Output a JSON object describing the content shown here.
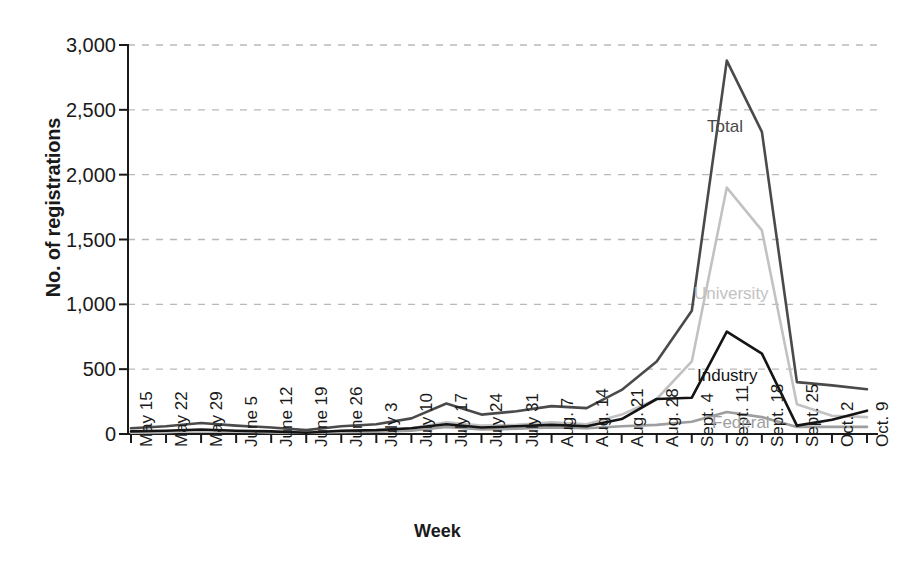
{
  "chart_data": {
    "type": "line",
    "title": "",
    "xlabel": "Week",
    "ylabel": "No. of registrations",
    "ylim": [
      0,
      3000
    ],
    "yticks": [
      0,
      500,
      1000,
      1500,
      2000,
      2500,
      3000
    ],
    "ytick_labels": [
      "0",
      "500",
      "1,000",
      "1,500",
      "2,000",
      "2,500",
      "3,000"
    ],
    "grid": true,
    "legend_position": "inline-annotation",
    "categories": [
      "May 15",
      "May 22",
      "May 29",
      "June 5",
      "June 12",
      "June 19",
      "June 26",
      "July 3",
      "July 10",
      "July 17",
      "July 24",
      "July 31",
      "Aug. 7",
      "Aug. 14",
      "Aug. 21",
      "Aug. 28",
      "Sept. 4",
      "Sept. 11",
      "Sept. 18",
      "Sept. 25",
      "Oct. 2",
      "Oct. 9"
    ],
    "series": [
      {
        "name": "Total",
        "color": "#4a4a4a",
        "values": [
          45,
          60,
          85,
          65,
          50,
          30,
          60,
          75,
          120,
          235,
          150,
          175,
          215,
          200,
          340,
          560,
          950,
          2880,
          2330,
          400,
          375,
          345
        ]
      },
      {
        "name": "University",
        "color": "#c2c2c2",
        "values": [
          10,
          15,
          25,
          20,
          15,
          10,
          20,
          25,
          45,
          90,
          65,
          70,
          90,
          75,
          150,
          270,
          560,
          1900,
          1570,
          230,
          140,
          130
        ]
      },
      {
        "name": "Industry",
        "color": "#141414",
        "values": [
          20,
          25,
          35,
          25,
          20,
          10,
          25,
          30,
          45,
          75,
          50,
          60,
          70,
          60,
          115,
          270,
          280,
          790,
          620,
          65,
          110,
          180
        ]
      },
      {
        "name": "Federal",
        "color": "#9e9e9e",
        "values": [
          15,
          18,
          22,
          18,
          14,
          10,
          15,
          18,
          25,
          55,
          35,
          40,
          50,
          45,
          60,
          70,
          95,
          170,
          130,
          55,
          55,
          55
        ]
      }
    ],
    "annotations": [
      {
        "text": "Total",
        "series": "Total"
      },
      {
        "text": "University",
        "series": "University"
      },
      {
        "text": "Industry",
        "series": "Industry"
      },
      {
        "text": "Federal",
        "series": "Federal"
      }
    ]
  },
  "axes": {
    "y_title": "No. of registrations",
    "x_title": "Week"
  },
  "colors": {
    "background": "#ffffff",
    "axis": "#1a1a1a",
    "gridline": "#b9b9b9",
    "total": "#4a4a4a",
    "university": "#c2c2c2",
    "industry": "#141414",
    "federal": "#9e9e9e"
  }
}
